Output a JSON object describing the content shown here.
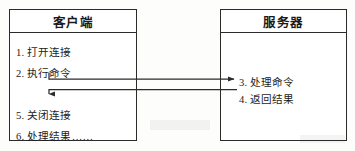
{
  "diagram": {
    "background_color": "#fdfdfc",
    "line_color": "#2b2b2b",
    "text_color": "#1c1c1c"
  },
  "client": {
    "header": "客户端",
    "steps": [
      {
        "id": 1,
        "label": "1. 打开连接"
      },
      {
        "id": 2,
        "label": "2. 执行命令"
      },
      {
        "id": 5,
        "label": "5. 关闭连接"
      },
      {
        "id": 6,
        "label": "6. 处理结果……"
      }
    ]
  },
  "server": {
    "header": "服务器",
    "steps": [
      {
        "id": 3,
        "label": "3. 处理命令"
      },
      {
        "id": 4,
        "label": "4. 返回结果"
      }
    ]
  },
  "connectors": [
    {
      "name": "request-arrow",
      "from": "client",
      "to": "server",
      "direction": "right",
      "note": "执行命令 -> 处理命令"
    },
    {
      "name": "response-arrow",
      "from": "server",
      "to": "client",
      "direction": "left-then-down",
      "note": "返回结果 -> 关闭连接"
    }
  ]
}
